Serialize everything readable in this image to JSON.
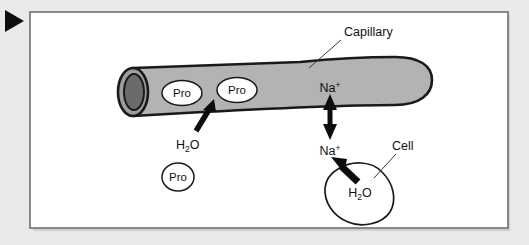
{
  "figure": {
    "kind": "biology-diagram",
    "marker_icon": "play-triangle-icon",
    "background_color": "#e9e9e9",
    "panel_color": "#ffffff",
    "frame_color": "#6e6e6e",
    "vessel_fill": "#b3b3b3",
    "vessel_stroke": "#1a1a1a",
    "lumen_opening_fill": "#6b6b6b",
    "ink_color": "#111111"
  },
  "labels": {
    "capillary": "Capillary",
    "cell": "Cell",
    "protein_1": "Pro",
    "protein_2": "Pro",
    "protein_3": "Pro",
    "sodium_inside": "Na",
    "sodium_inside_charge": "+",
    "sodium_outside": "Na",
    "sodium_outside_charge": "+",
    "water_interstitial_h": "H",
    "water_interstitial_sub": "2",
    "water_interstitial_o": "O",
    "water_cell_h": "H",
    "water_cell_sub": "2",
    "water_cell_o": "O"
  }
}
